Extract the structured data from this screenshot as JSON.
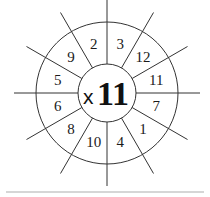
{
  "wheel": {
    "operator": "x",
    "multiplier": "11",
    "numbers": [
      {
        "value": "3",
        "angle": -75
      },
      {
        "value": "12",
        "angle": -45
      },
      {
        "value": "11",
        "angle": -15
      },
      {
        "value": "7",
        "angle": 15
      },
      {
        "value": "1",
        "angle": 45
      },
      {
        "value": "4",
        "angle": 75
      },
      {
        "value": "10",
        "angle": 105
      },
      {
        "value": "8",
        "angle": 135
      },
      {
        "value": "6",
        "angle": 165
      },
      {
        "value": "5",
        "angle": 195
      },
      {
        "value": "9",
        "angle": 225
      },
      {
        "value": "2",
        "angle": 255
      }
    ],
    "line_color": "#333333"
  }
}
